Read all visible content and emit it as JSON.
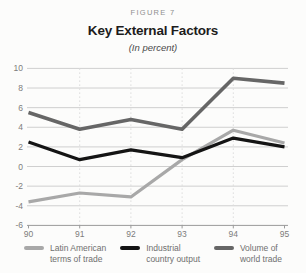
{
  "figure": {
    "label": "FIGURE 7",
    "title": "Key External Factors",
    "subtitle": "(In percent)"
  },
  "chart_data": {
    "type": "line",
    "x": [
      90,
      91,
      92,
      93,
      94,
      95
    ],
    "x_tick_labels": [
      "90",
      "91",
      "92",
      "93",
      "94",
      "95"
    ],
    "xlabel": "",
    "ylabel": "",
    "ylim": [
      -6,
      10
    ],
    "y_ticks": [
      -6,
      -4,
      -2,
      0,
      2,
      4,
      6,
      8,
      10
    ],
    "grid": "horizontal solid lines at every 2 units; vertical dotted lines at interior year ticks",
    "legend_position": "bottom",
    "series": [
      {
        "name": "Latin American terms of trade",
        "legend_lines": [
          "Latin American",
          "terms of trade"
        ],
        "color": "#a8a8a8",
        "stroke_width": 3.2,
        "values": [
          -3.6,
          -2.7,
          -3.1,
          0.7,
          3.7,
          2.4
        ]
      },
      {
        "name": "Industrial country output",
        "legend_lines": [
          "Industrial",
          "country output"
        ],
        "color": "#141414",
        "stroke_width": 3.2,
        "values": [
          2.5,
          0.7,
          1.7,
          0.9,
          2.9,
          2.0
        ]
      },
      {
        "name": "Volume of world trade",
        "legend_lines": [
          "Volume of",
          "world trade"
        ],
        "color": "#666666",
        "stroke_width": 3.6,
        "values": [
          5.5,
          3.8,
          4.8,
          3.8,
          9.0,
          8.5
        ]
      }
    ],
    "draw_order": [
      0,
      2,
      1
    ],
    "colors": {
      "background": "#fcfcfb",
      "gridline": "#cfcfcf",
      "dotted_gridline": "#dcdcdc",
      "axis": "#9a9a9a",
      "tick_label": "#7c7c7c"
    }
  }
}
